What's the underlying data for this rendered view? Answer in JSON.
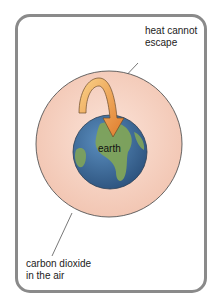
{
  "diagram": {
    "title": "",
    "labels": {
      "heat": [
        "heat cannot",
        "escape"
      ],
      "co2": [
        "carbon dioxide",
        "in the air"
      ],
      "earth": "earth"
    },
    "colors": {
      "card_border": "#8a8a8a",
      "atmosphere_fill": "#f6d2c2",
      "atmosphere_stroke": "#555555",
      "ocean": "#3f6f9e",
      "land": "#6f9a4e",
      "arrow_light": "#f7c06a",
      "arrow_dark": "#e07a2a"
    }
  }
}
